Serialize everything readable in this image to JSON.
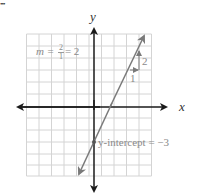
{
  "figure": {
    "corner_mark": "•••",
    "axes": {
      "x_label": "x",
      "y_label": "y"
    },
    "slope_label": {
      "prefix": "m = ",
      "numerator": "2",
      "denominator": "1",
      "suffix": "= 2"
    },
    "rise_label": "2",
    "run_label": "1",
    "intercept_label": "y-intercept = −3",
    "colors": {
      "grid": "#d4d4d4",
      "axis": "#1a1a1a",
      "line": "#7a7a7a",
      "text": "#8a8a8a",
      "point": "#555555"
    },
    "line": {
      "slope": 2,
      "intercept": -3,
      "equation": "y = 2x - 3"
    }
  }
}
